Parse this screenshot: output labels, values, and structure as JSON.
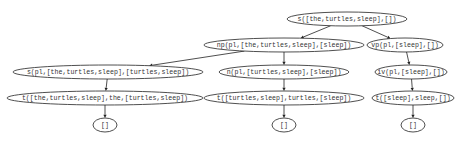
{
  "diagram": {
    "type": "parse-tree",
    "nodes": [
      {
        "id": "n0",
        "label": "s([the,turtles,sleep],[])",
        "cx": 347,
        "cy": 19,
        "rx": 60,
        "ry": 7
      },
      {
        "id": "n1",
        "label": "np(pl,[the,turtles,sleep],[sleep])",
        "cx": 284,
        "cy": 45,
        "rx": 80,
        "ry": 7
      },
      {
        "id": "n2",
        "label": "vp(pl,[sleep],[])",
        "cx": 405,
        "cy": 45,
        "rx": 38,
        "ry": 7
      },
      {
        "id": "n3",
        "label": "s(pl,[the,turtles,sleep],[turtles,sleep])",
        "cx": 108,
        "cy": 72,
        "rx": 95,
        "ry": 7
      },
      {
        "id": "n4",
        "label": "n(pl,[turtles,sleep],[sleep])",
        "cx": 284,
        "cy": 72,
        "rx": 65,
        "ry": 7
      },
      {
        "id": "n5",
        "label": "iv(pl,[sleep],[])",
        "cx": 411,
        "cy": 72,
        "rx": 36,
        "ry": 7
      },
      {
        "id": "n6",
        "label": "t([the,turtles,sleep],the,[turtles,sleep])",
        "cx": 105,
        "cy": 98,
        "rx": 98,
        "ry": 7
      },
      {
        "id": "n7",
        "label": "t([turtles,sleep],turtles,[sleep])",
        "cx": 284,
        "cy": 98,
        "rx": 80,
        "ry": 7
      },
      {
        "id": "n8",
        "label": "t([sleep],sleep,[])",
        "cx": 413,
        "cy": 98,
        "rx": 41,
        "ry": 7
      },
      {
        "id": "n9",
        "label": "[]",
        "cx": 105,
        "cy": 125,
        "rx": 12,
        "ry": 7
      },
      {
        "id": "n10",
        "label": "[]",
        "cx": 284,
        "cy": 125,
        "rx": 12,
        "ry": 7
      },
      {
        "id": "n11",
        "label": "[]",
        "cx": 413,
        "cy": 125,
        "rx": 12,
        "ry": 7
      }
    ],
    "edges": [
      {
        "from": "n0",
        "to": "n1"
      },
      {
        "from": "n0",
        "to": "n2"
      },
      {
        "from": "n1",
        "to": "n3"
      },
      {
        "from": "n1",
        "to": "n4"
      },
      {
        "from": "n2",
        "to": "n5"
      },
      {
        "from": "n3",
        "to": "n6"
      },
      {
        "from": "n4",
        "to": "n7"
      },
      {
        "from": "n5",
        "to": "n8"
      },
      {
        "from": "n6",
        "to": "n9"
      },
      {
        "from": "n7",
        "to": "n10"
      },
      {
        "from": "n8",
        "to": "n11"
      }
    ]
  }
}
